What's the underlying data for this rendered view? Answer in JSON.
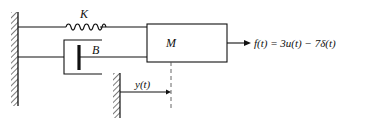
{
  "diagram": {
    "spring_label": "K",
    "damper_label": "B",
    "mass_label": "M",
    "force_label": "f(t) = 3u(t) − 7δ(t)",
    "displacement_label": "y(t)"
  }
}
